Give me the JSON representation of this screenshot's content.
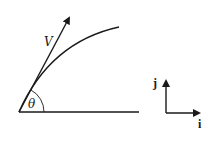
{
  "diagram": {
    "type": "projectile-velocity-diagram",
    "labels": {
      "velocity": "V",
      "angle": "θ",
      "unit_i": "i",
      "unit_j": "j"
    },
    "colors": {
      "ink": "#1a1a1a",
      "background": "#ffffff"
    },
    "elements": {
      "ground_line": {
        "x1": 19,
        "y1": 112,
        "x2": 139,
        "y2": 112
      },
      "velocity_vector": {
        "x1": 19,
        "y1": 112,
        "x2": 71,
        "y2": 14
      },
      "trajectory_curve": {
        "start": [
          19,
          112
        ],
        "control": [
          50,
          40
        ],
        "end": [
          119,
          27
        ]
      },
      "angle_arc": {
        "center": [
          19,
          112
        ],
        "radius": 25
      },
      "unit_vectors": {
        "origin": [
          166,
          113
        ],
        "j_tip": [
          166,
          77
        ],
        "i_tip": [
          203,
          113
        ]
      }
    }
  }
}
